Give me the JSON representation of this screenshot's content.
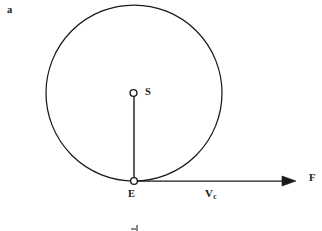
{
  "figure": {
    "panel_label": "a",
    "background_color": "#ffffff",
    "stroke_color": "#1a1a1a",
    "width": 322,
    "height": 231
  },
  "diagram": {
    "type": "orbital-mechanics-schematic",
    "orbit": {
      "name": "circular-orbit",
      "center_x": 134,
      "center_y": 93,
      "radius": 88,
      "stroke_width": 1.2,
      "fill": "none"
    },
    "points": [
      {
        "id": "S",
        "label": "S",
        "name": "point-s-marker",
        "x": 133.5,
        "y": 93,
        "marker_radius": 3.4,
        "label_x": 145,
        "label_y": 87
      },
      {
        "id": "E",
        "label": "E",
        "name": "point-e-marker",
        "x": 134,
        "y": 181,
        "marker_radius": 3.4,
        "label_x": 128,
        "label_y": 189
      }
    ],
    "segments": [
      {
        "name": "radius-line-s-to-e",
        "x1": 134,
        "y1": 97,
        "x2": 134,
        "y2": 178,
        "stroke_width": 1.3
      }
    ],
    "vectors": [
      {
        "name": "force-vector-f",
        "label": "F",
        "magnitude_label": "V",
        "magnitude_subscript": "c",
        "x1": 137,
        "y1": 181,
        "x2": 296,
        "y2": 181,
        "stroke_width": 1.2,
        "arrowhead_length": 13,
        "arrowhead_width": 9,
        "tip_label_x": 309,
        "tip_label_y": 173,
        "mid_label_x": 205,
        "mid_label_y": 188
      }
    ]
  },
  "labels": {
    "panel": "a",
    "s": "S",
    "e": "E",
    "f": "F",
    "vc_base": "V",
    "vc_sub": "c"
  }
}
